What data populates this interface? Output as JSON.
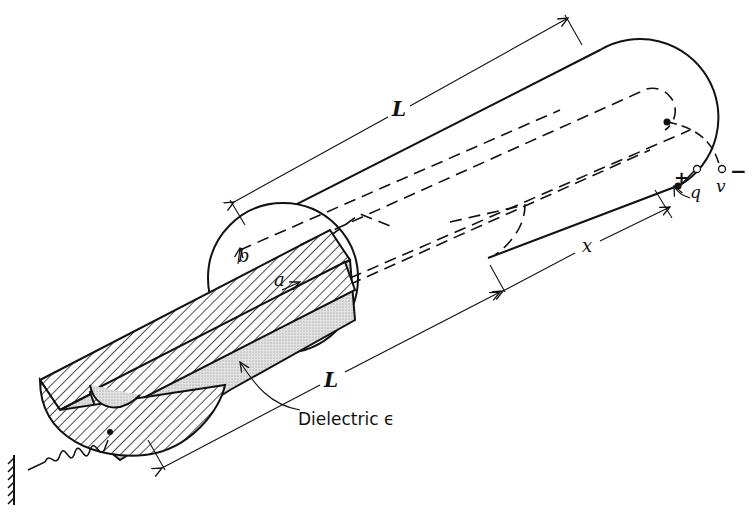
{
  "figure": {
    "labels": {
      "length_top": "L",
      "length_bottom": "L",
      "displacement": "x",
      "outer_radius": "b",
      "inner_radius": "a",
      "dielectric": "Dielectric ϵ",
      "charge": "q",
      "plus": "+",
      "voltage": "v",
      "minus": "−"
    },
    "colors": {
      "ink": "#111111",
      "background": "#ffffff",
      "dielectric_fill": "#d6d6d6"
    }
  }
}
